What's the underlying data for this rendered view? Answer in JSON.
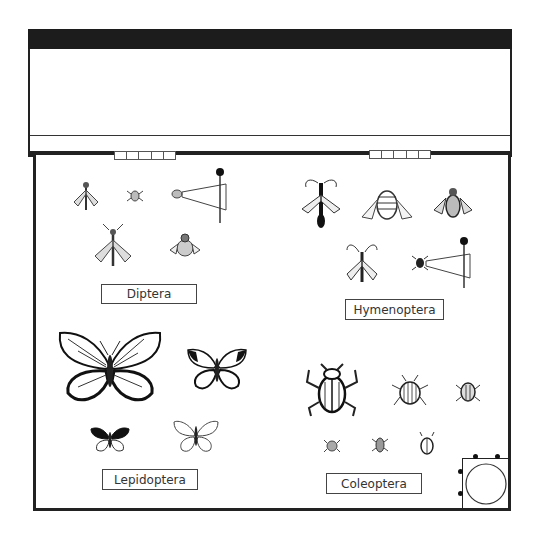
{
  "hinges": [
    {
      "name": "left-hinge",
      "segments": 5
    },
    {
      "name": "right-hinge",
      "segments": 5
    }
  ],
  "groups": [
    {
      "id": "diptera",
      "label": "Diptera",
      "specimens": [
        "fly",
        "small-fly",
        "pinned-fly-with-label",
        "crane-fly",
        "bee-fly"
      ]
    },
    {
      "id": "hymenoptera",
      "label": "Hymenoptera",
      "specimens": [
        "wasp",
        "bumblebee",
        "bee",
        "ichneumon",
        "pinned-ant-with-label"
      ]
    },
    {
      "id": "lepidoptera",
      "label": "Lepidoptera",
      "specimens": [
        "large-butterfly",
        "black-tipped-butterfly",
        "small-butterfly",
        "white-butterfly"
      ]
    },
    {
      "id": "coleoptera",
      "label": "Coleoptera",
      "specimens": [
        "large-beetle",
        "striped-beetle",
        "small-beetle",
        "tiny-beetle-1",
        "tiny-beetle-2",
        "tiny-beetle-3"
      ]
    }
  ],
  "corner_item": "round-container"
}
